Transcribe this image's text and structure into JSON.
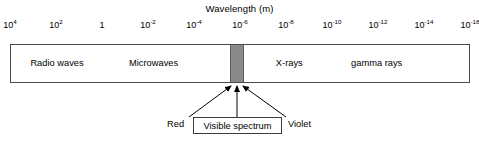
{
  "chart_data": {
    "type": "bar",
    "title": "Wavelength (m)",
    "xlabel": "Wavelength (m)",
    "ylabel": "",
    "grid": false,
    "legend": "none",
    "orientation": "horizontal",
    "axis": {
      "label": "Wavelength (m)",
      "position": "top",
      "scale": "log",
      "direction": "decreasing",
      "tick_labels": [
        {
          "base": "10",
          "exponent": "4",
          "text": "10^4",
          "value": 10000
        },
        {
          "base": "10",
          "exponent": "2",
          "text": "10^2",
          "value": 100
        },
        {
          "base": "1",
          "exponent": "",
          "text": "1",
          "value": 1
        },
        {
          "base": "10",
          "exponent": "-2",
          "text": "10^-2",
          "value": 0.01
        },
        {
          "base": "10",
          "exponent": "-4",
          "text": "10^-4",
          "value": 0.0001
        },
        {
          "base": "10",
          "exponent": "-6",
          "text": "10^-6",
          "value": 1e-06
        },
        {
          "base": "10",
          "exponent": "-8",
          "text": "10^-8",
          "value": 1e-08
        },
        {
          "base": "10",
          "exponent": "-10",
          "text": "10^-10",
          "value": 1e-10
        },
        {
          "base": "10",
          "exponent": "-12",
          "text": "10^-12",
          "value": 1e-12
        },
        {
          "base": "10",
          "exponent": "-14",
          "text": "10^-14",
          "value": 1e-14
        },
        {
          "base": "10",
          "exponent": "-18",
          "text": "10^-18",
          "value": 1e-18
        }
      ]
    },
    "categories": [
      "Radio waves",
      "Microwaves",
      "Visible spectrum",
      "X-rays",
      "gamma rays"
    ],
    "bands": [
      {
        "name": "Radio waves",
        "label": "Radio waves",
        "center_pct": 10.0,
        "fill": "#ffffff"
      },
      {
        "name": "Microwaves",
        "label": "Microwaves",
        "center_pct": 31.0,
        "fill": "#ffffff"
      },
      {
        "name": "Visible spectrum",
        "label": "",
        "center_pct": 49.1,
        "fill": "#8a8a8a"
      },
      {
        "name": "X-rays",
        "label": "X-rays",
        "center_pct": 60.5,
        "fill": "#ffffff"
      },
      {
        "name": "gamma rays",
        "label": "gamma rays",
        "center_pct": 79.5,
        "fill": "#ffffff"
      }
    ],
    "annotations": [
      {
        "name": "red",
        "text": "Red",
        "points_to": "visible-band",
        "side": "left"
      },
      {
        "name": "visible-spectrum",
        "text": "Visible spectrum",
        "points_to": "visible-band",
        "side": "center",
        "boxed": true
      },
      {
        "name": "violet",
        "text": "Violet",
        "points_to": "visible-band",
        "side": "right"
      }
    ],
    "colors": {
      "visible_band": "#8a8a8a",
      "bar_border": "#4a4a4a",
      "background": "#ffffff",
      "text": "#000000"
    }
  }
}
